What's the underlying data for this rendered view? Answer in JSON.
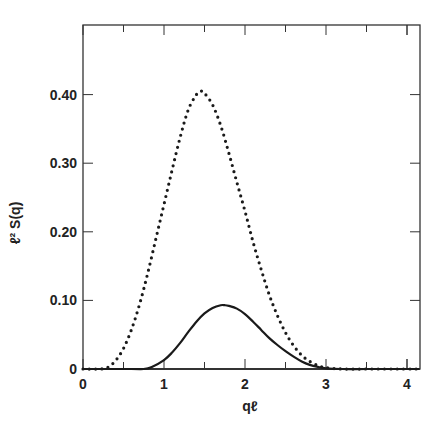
{
  "chart_data": {
    "type": "line",
    "title": "",
    "xlabel": "qℓ",
    "ylabel": "ℓ² S(q)",
    "xlim": [
      0,
      4.15
    ],
    "ylim": [
      0,
      0.5
    ],
    "grid": false,
    "legend": null,
    "x_ticks": [
      0,
      1,
      2,
      3,
      4
    ],
    "x_tick_labels": [
      "0",
      "1",
      "2",
      "3",
      "4"
    ],
    "x_minor_ticks": [
      0.5,
      1.5,
      2.5,
      3.5,
      4.0
    ],
    "y_ticks": [
      0,
      0.1,
      0.2,
      0.3,
      0.4
    ],
    "y_tick_labels": [
      "0",
      "0.10",
      "0.20",
      "0.30",
      "0.40"
    ],
    "series": [
      {
        "name": "dotted",
        "style": "dotted",
        "x": [
          0,
          0.2,
          0.3,
          0.4,
          0.5,
          0.6,
          0.7,
          0.8,
          0.9,
          1.0,
          1.1,
          1.2,
          1.3,
          1.4,
          1.45,
          1.5,
          1.6,
          1.7,
          1.8,
          1.9,
          2.0,
          2.1,
          2.2,
          2.3,
          2.4,
          2.5,
          2.6,
          2.7,
          2.8,
          2.9,
          3.0,
          3.2,
          3.5,
          4.0,
          4.15
        ],
        "y": [
          0.0,
          0.0,
          0.002,
          0.012,
          0.03,
          0.058,
          0.095,
          0.14,
          0.19,
          0.24,
          0.29,
          0.338,
          0.378,
          0.4,
          0.405,
          0.402,
          0.385,
          0.355,
          0.315,
          0.272,
          0.23,
          0.185,
          0.145,
          0.108,
          0.078,
          0.053,
          0.034,
          0.02,
          0.011,
          0.005,
          0.002,
          0.0,
          0.0,
          0.0,
          0.0
        ]
      },
      {
        "name": "solid",
        "style": "solid",
        "x": [
          0,
          0.6,
          0.75,
          0.85,
          1.0,
          1.1,
          1.2,
          1.3,
          1.4,
          1.5,
          1.6,
          1.7,
          1.75,
          1.8,
          1.9,
          2.0,
          2.1,
          2.2,
          2.3,
          2.4,
          2.5,
          2.6,
          2.7,
          2.8,
          2.9,
          3.0,
          3.2,
          3.5,
          4.0,
          4.15
        ],
        "y": [
          0.0,
          0.0,
          0.0,
          0.003,
          0.013,
          0.024,
          0.038,
          0.054,
          0.069,
          0.081,
          0.089,
          0.093,
          0.093,
          0.092,
          0.088,
          0.08,
          0.069,
          0.057,
          0.045,
          0.035,
          0.026,
          0.018,
          0.011,
          0.006,
          0.003,
          0.001,
          0.0,
          0.0,
          0.0,
          0.0
        ]
      }
    ]
  },
  "plot": {
    "frame": {
      "left": 83,
      "right": 420,
      "top": 25,
      "bottom": 369
    },
    "x_px_per_unit": 81,
    "y_px_per_unit": 686,
    "line_color": "#1a1a1a",
    "axis_color": "#333333"
  }
}
